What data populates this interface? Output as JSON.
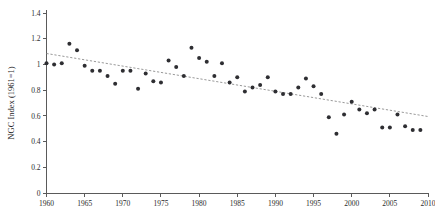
{
  "chart_data": {
    "type": "scatter",
    "title": "",
    "xlabel": "",
    "ylabel": "NGC Index (1961=1)",
    "xlim": [
      1960,
      2010
    ],
    "ylim": [
      0,
      1.4
    ],
    "grid": false,
    "legend": null,
    "x_ticks": [
      1960,
      1965,
      1970,
      1975,
      1980,
      1985,
      1990,
      1995,
      2000,
      2005,
      2010
    ],
    "x_tick_labels": [
      "1960",
      "1965",
      "1970",
      "1975",
      "1980",
      "1985",
      "1990",
      "1995",
      "2000",
      "2005",
      "2010"
    ],
    "y_ticks": [
      0,
      0.2,
      0.4,
      0.6,
      0.8,
      1,
      1.2,
      1.4
    ],
    "y_tick_labels": [
      "0",
      "0.2",
      "0.4",
      "0.6",
      "0.8",
      "1",
      "1.2",
      "1.4"
    ],
    "series": [
      {
        "name": "NGC Index",
        "marker": "circle",
        "color": "#2e2e32",
        "x": [
          1960,
          1961,
          1962,
          1963,
          1964,
          1965,
          1966,
          1967,
          1968,
          1969,
          1970,
          1971,
          1972,
          1973,
          1974,
          1975,
          1976,
          1977,
          1978,
          1979,
          1980,
          1981,
          1982,
          1983,
          1984,
          1985,
          1986,
          1987,
          1988,
          1989,
          1990,
          1991,
          1992,
          1993,
          1994,
          1995,
          1996,
          1997,
          1998,
          1999,
          2000,
          2001,
          2002,
          2003,
          2004,
          2005,
          2006,
          2007,
          2008,
          2009
        ],
        "y": [
          1.01,
          1.0,
          1.01,
          1.16,
          1.11,
          0.99,
          0.95,
          0.95,
          0.91,
          0.85,
          0.95,
          0.95,
          0.81,
          0.93,
          0.87,
          0.86,
          1.03,
          0.98,
          0.91,
          1.13,
          1.05,
          1.02,
          0.91,
          1.01,
          0.86,
          0.9,
          0.79,
          0.82,
          0.84,
          0.9,
          0.79,
          0.77,
          0.77,
          0.82,
          0.89,
          0.83,
          0.77,
          0.59,
          0.46,
          0.61,
          0.71,
          0.65,
          0.62,
          0.65,
          0.51,
          0.51,
          0.61,
          0.52,
          0.49,
          0.49
        ]
      }
    ],
    "trend_line": {
      "name": "linear-trend",
      "style": "dashed",
      "color": "#8d8d8d",
      "x_start": 1960,
      "y_start": 1.085,
      "x_end": 2010,
      "y_end": 0.595
    }
  }
}
